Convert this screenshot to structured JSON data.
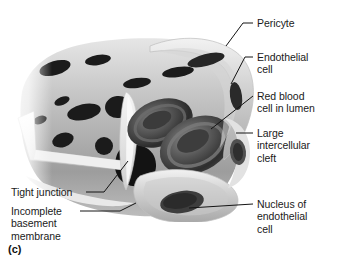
{
  "figure": {
    "panel_letter": "(c)",
    "palette": {
      "background": "#ffffff",
      "text": "#1a1a1a",
      "leader_line": "#141414",
      "tissue_light": "#dcdcdc",
      "tissue_mid": "#b4b4b4",
      "tissue_dark": "#8a8a8a",
      "cleft_black": "#171717",
      "rbc_dark": "#3a3a3a",
      "highlight_white": "#fbfbfb"
    }
  },
  "labels": {
    "pericyte": "Pericyte",
    "endothelial_cell": "Endothelial\ncell",
    "red_blood_cell": "Red blood\ncell in lumen",
    "intercellular_cleft": "Large\nintercellular\ncleft",
    "nucleus": "Nucleus of\nendothelial\ncell",
    "tight_junction": "Tight junction",
    "basement_membrane": "Incomplete\nbasement\nmembrane"
  }
}
